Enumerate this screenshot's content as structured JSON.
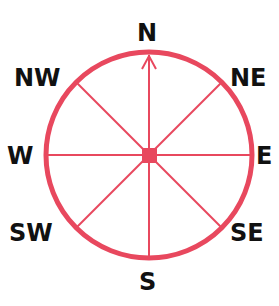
{
  "diagram": {
    "type": "compass-rose",
    "ring_color": "#e8485e",
    "label_color": "#111111",
    "center_marker": "square",
    "north_arrow": true,
    "labels": {
      "n": "N",
      "ne": "NE",
      "e": "E",
      "se": "SE",
      "s": "S",
      "sw": "SW",
      "w": "W",
      "nw": "NW"
    }
  }
}
